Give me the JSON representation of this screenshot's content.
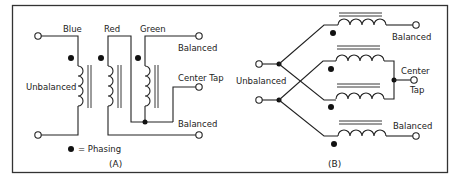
{
  "figure": {
    "border_color": "#333333",
    "panel_a": {
      "caption": "(A)",
      "winding_labels": {
        "blue": "Blue",
        "red": "Red",
        "green": "Green"
      },
      "left_label": "Unbalanced",
      "right_labels": {
        "top": "Balanced",
        "center": "Center Tap",
        "bottom": "Balanced"
      },
      "legend": {
        "symbol": "●",
        "text": "= Phasing"
      }
    },
    "panel_b": {
      "caption": "(B)",
      "left_label": "Unbalanced",
      "right_labels": {
        "top": "Balanced",
        "center_line1": "Center",
        "center_line2": "Tap",
        "bottom": "Balanced"
      }
    }
  }
}
